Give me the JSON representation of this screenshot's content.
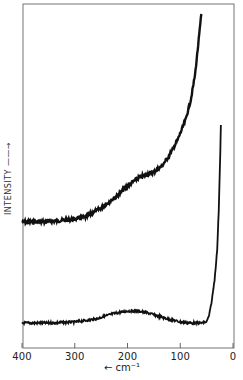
{
  "chart_data": {
    "type": "line",
    "title": "",
    "xlabel": "← cm⁻¹",
    "ylabel": "INTENSITY →",
    "xlim": [
      400,
      0
    ],
    "x_ticks": [
      400,
      300,
      200,
      100,
      0
    ],
    "x_tick_labels": [
      "400",
      "300",
      "200",
      "100",
      "0"
    ],
    "y_ticks": [],
    "grid": false,
    "legend": null,
    "series": [
      {
        "name": "upper spectrum",
        "x": [
          400,
          370,
          340,
          310,
          280,
          250,
          220,
          200,
          180,
          165,
          150,
          135,
          120,
          105,
          90,
          80,
          72,
          66,
          60
        ],
        "y_px": [
          222,
          222,
          221,
          220,
          217,
          208,
          196,
          186,
          178,
          175,
          172,
          166,
          155,
          140,
          120,
          100,
          75,
          45,
          14
        ],
        "note": "relative intensity (pixel y in plot frame, smaller = higher intensity); noisy trace with shoulder near 160 cm-1"
      },
      {
        "name": "lower spectrum",
        "x": [
          400,
          350,
          300,
          260,
          230,
          200,
          180,
          160,
          130,
          100,
          80,
          60,
          50,
          45,
          40,
          35,
          30,
          27,
          24,
          23
        ],
        "y_px": [
          323,
          323,
          322,
          319,
          314,
          311,
          311,
          313,
          318,
          322,
          323,
          323,
          322,
          315,
          300,
          280,
          250,
          210,
          150,
          125
        ],
        "note": "relative intensity; broad weak hump peaking near 190 cm-1, sharp rise below 50 cm-1"
      }
    ]
  },
  "axis": {
    "tick_labels": [
      "400",
      "300",
      "200",
      "100",
      "0"
    ],
    "xlabel": "← cm⁻¹",
    "ylabel": "INTENSITY ——→"
  }
}
